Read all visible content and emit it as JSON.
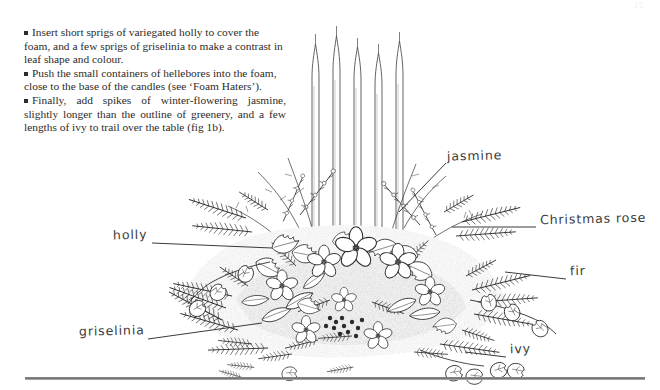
{
  "page": {
    "page_number": "25",
    "background_color": "#ffffff",
    "ink_color": "#2e2b29"
  },
  "text_block": {
    "paragraphs": [
      {
        "bullet": "square-bullet",
        "text": "Insert short sprigs of variegated holly to cover the foam, and a few sprigs of griselinia to make a contrast in leaf shape and colour.",
        "justified": false
      },
      {
        "bullet": "square-bullet",
        "text": "Push the small containers of hellebores into the foam, close to the base of the candles (see ‘Foam Haters’).",
        "justified": false
      },
      {
        "bullet": "square-bullet",
        "text": "Finally, add spikes of winter-flowering jasmine, slightly longer than the outline of greenery, and a few lengths of ivy to trail over the table (fig 1b).",
        "justified": true
      }
    ]
  },
  "illustration": {
    "caption_figure": "fig 1b",
    "description": "Pen-and-ink drawing of a low Christmas table arrangement with five tall tapered candles rising from a dense mound of evergreen foliage, hellebores, holly, fir, griselinia, jasmine spikes and trailing ivy.",
    "candle_count": 5,
    "labels": [
      {
        "id": "jasmine",
        "text": "jasmine",
        "x": 447,
        "y": 148,
        "leader": {
          "x1": 446,
          "y1": 163,
          "x2": 399,
          "y2": 212
        }
      },
      {
        "id": "christmas-rose",
        "text": "Christmas rose",
        "x": 540,
        "y": 218,
        "leader": {
          "x1": 536,
          "y1": 227,
          "x2": 452,
          "y2": 227
        }
      },
      {
        "id": "fir",
        "text": "fir",
        "x": 570,
        "y": 270,
        "leader": {
          "x1": 566,
          "y1": 279,
          "x2": 505,
          "y2": 272
        }
      },
      {
        "id": "ivy",
        "text": "ivy",
        "x": 510,
        "y": 348,
        "leader": {
          "x1": 506,
          "y1": 357,
          "x2": 465,
          "y2": 352
        }
      },
      {
        "id": "holly",
        "text": "holly",
        "x": 113,
        "y": 234,
        "leader": {
          "x1": 152,
          "y1": 243,
          "x2": 272,
          "y2": 248
        }
      },
      {
        "id": "griselinia",
        "text": "griselinia",
        "x": 79,
        "y": 330,
        "leader": {
          "x1": 148,
          "y1": 339,
          "x2": 262,
          "y2": 323
        }
      }
    ]
  },
  "footer": {
    "rule": "horizontal-rule",
    "color": "#6f6f6f"
  }
}
